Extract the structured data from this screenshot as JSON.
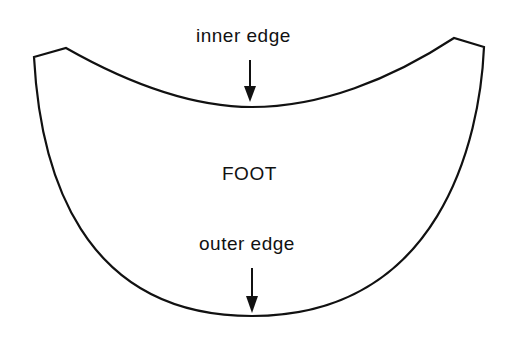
{
  "diagram": {
    "shape_name": "foot",
    "labels": {
      "inner_edge": "inner edge",
      "center": "FOOT",
      "outer_edge": "outer edge"
    },
    "colors": {
      "stroke": "#111111",
      "background": "#ffffff"
    }
  }
}
